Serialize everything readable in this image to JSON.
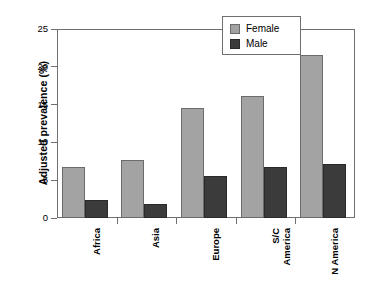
{
  "chart_data": {
    "type": "bar",
    "title": "",
    "xlabel": "",
    "ylabel": "Adjusted prevalence (%)",
    "ylim": [
      0,
      25
    ],
    "yticks": [
      0,
      5,
      10,
      15,
      20,
      25
    ],
    "ytick_labels": [
      "0",
      "5",
      "10",
      "15",
      "20",
      "25"
    ],
    "grid": false,
    "legend_position": "top-right",
    "categories": [
      "Africa",
      "Asia",
      "Europe",
      "S/C America",
      "N America"
    ],
    "category_labels": [
      "Africa",
      "Asia",
      "Europe",
      "S/C\nAmerica",
      "N America"
    ],
    "series": [
      {
        "name": "Female",
        "color": "#a3a3a3",
        "values": [
          6.8,
          7.7,
          14.6,
          16.2,
          21.5
        ]
      },
      {
        "name": "Male",
        "color": "#3b3b3b",
        "values": [
          2.4,
          1.9,
          5.6,
          6.8,
          7.2
        ]
      }
    ]
  },
  "legend": {
    "items": [
      {
        "label": "Female",
        "swatch": "female-swatch"
      },
      {
        "label": "Male",
        "swatch": "male-swatch"
      }
    ]
  },
  "axes": {
    "y_title": "Adjusted prevalence (%)"
  }
}
